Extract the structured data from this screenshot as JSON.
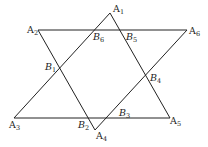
{
  "diagram": {
    "type": "geometry-figure",
    "points": [
      {
        "id": "A1",
        "letter": "A",
        "sub": "1",
        "x": 110,
        "y": 13,
        "lx": 113,
        "ly": 12
      },
      {
        "id": "A2",
        "letter": "A",
        "sub": "2",
        "x": 38,
        "y": 30,
        "lx": 27,
        "ly": 33
      },
      {
        "id": "A3",
        "letter": "A",
        "sub": "3",
        "x": 14,
        "y": 118,
        "lx": 9,
        "ly": 128
      },
      {
        "id": "A4",
        "letter": "A",
        "sub": "4",
        "x": 95,
        "y": 130,
        "lx": 96,
        "ly": 139
      },
      {
        "id": "A5",
        "letter": "A",
        "sub": "5",
        "x": 170,
        "y": 118,
        "lx": 170,
        "ly": 124
      },
      {
        "id": "A6",
        "letter": "A",
        "sub": "6",
        "x": 187,
        "y": 30,
        "lx": 189,
        "ly": 34
      },
      {
        "id": "B1",
        "letter": "B",
        "sub": "1",
        "x": 59,
        "y": 69,
        "lx": 45,
        "ly": 70
      },
      {
        "id": "B2",
        "letter": "B",
        "sub": "2",
        "x": 87,
        "y": 118,
        "lx": 78,
        "ly": 128
      },
      {
        "id": "B3",
        "letter": "B",
        "sub": "3",
        "x": 111,
        "y": 118,
        "lx": 119,
        "ly": 116
      },
      {
        "id": "B4",
        "letter": "B",
        "sub": "4",
        "x": 148,
        "y": 77,
        "lx": 150,
        "ly": 81
      },
      {
        "id": "B5",
        "letter": "B",
        "sub": "5",
        "x": 120,
        "y": 30,
        "lx": 126,
        "ly": 40
      },
      {
        "id": "B6",
        "letter": "B",
        "sub": "6",
        "x": 92,
        "y": 30,
        "lx": 93,
        "ly": 40
      }
    ],
    "segments": [
      {
        "from": "A1",
        "to": "A3"
      },
      {
        "from": "A1",
        "to": "A5"
      },
      {
        "from": "A3",
        "to": "A5"
      },
      {
        "from": "A2",
        "to": "A4"
      },
      {
        "from": "A4",
        "to": "A6"
      },
      {
        "from": "A2",
        "to": "A6"
      }
    ]
  }
}
